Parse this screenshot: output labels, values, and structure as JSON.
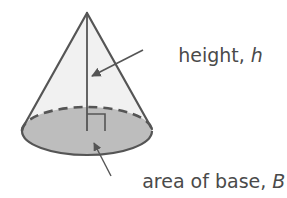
{
  "diagram": {
    "type": "cone",
    "labels": {
      "height": {
        "text": "height, ",
        "variable": "h"
      },
      "base": {
        "text": "area of base, ",
        "variable": "B"
      }
    },
    "colors": {
      "background": "#ffffff",
      "cone_fill": "#f1f1f1",
      "base_fill": "#bdbdbd",
      "stroke": "#555555",
      "text": "#4a4a4a",
      "arrow": "#555555"
    },
    "geometry": {
      "apex": [
        87,
        13
      ],
      "base_center": [
        87,
        131
      ],
      "base_rx": 65,
      "base_ry": 24,
      "right_angle_box": [
        87,
        114,
        18,
        17
      ]
    }
  }
}
